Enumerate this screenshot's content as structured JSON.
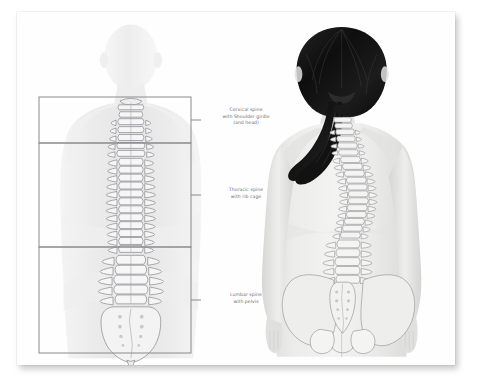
{
  "figure": {
    "ink_color": "#8b8b90",
    "box_color": "#8a8a8f",
    "label_color": "#6f6f74",
    "hair_color": "#161616",
    "skin_color": "#e8e8e6",
    "paper_color": "#fefefe"
  },
  "left_figure": {
    "name": "pale-rear-view-body-with-spine",
    "description": "Faint frontal-plane rear view of a human body with the vertebral column drawn in detail"
  },
  "right_figure": {
    "name": "shaded-rear-view-female-with-spine",
    "description": "Shaded rear view of a standing woman with long dark hair in a ponytail, spine and pelvis overlaid"
  },
  "regions": [
    {
      "id": "cervical",
      "lines": [
        "Cervical spine",
        "with Shoulder girdle",
        "(and head)"
      ],
      "box": {
        "x": 22,
        "y": 85,
        "w": 152,
        "h": 46
      }
    },
    {
      "id": "thoracic",
      "lines": [
        "Thoracic spine",
        "with rib cage"
      ],
      "box": {
        "x": 22,
        "y": 131,
        "w": 152,
        "h": 104
      }
    },
    {
      "id": "lumbar",
      "lines": [
        "Lumbar spine",
        "with pelvis"
      ],
      "box": {
        "x": 22,
        "y": 235,
        "w": 152,
        "h": 106
      }
    }
  ]
}
